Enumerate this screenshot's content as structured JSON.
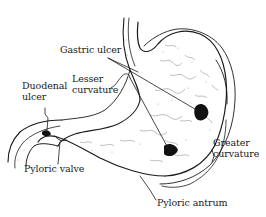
{
  "diagram": {
    "labels": {
      "gastric_ulcer": "Gastric ulcer",
      "lesser_curvature": [
        "Lesser",
        "curvature"
      ],
      "duodenal_ulcer": [
        "Duodenal",
        "ulcer"
      ],
      "pyloric_valve": "Pyloric valve",
      "greater_curvature": [
        "Greater",
        "curvature"
      ],
      "pyloric_antrum": "Pyloric antrum"
    },
    "colors": {
      "line": "#1a1a1a",
      "ulcer": "#111111",
      "background": "#ffffff",
      "texture": "#555555"
    }
  }
}
